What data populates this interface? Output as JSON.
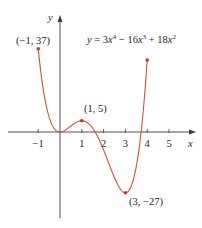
{
  "chart_data": {
    "type": "line",
    "equation": {
      "prefix": "y = 3",
      "x1": "x",
      "p1": "4",
      "mid1": " − 16",
      "x2": "x",
      "p2": "3",
      "mid2": " + 18",
      "x3": "x",
      "p3": "2"
    },
    "xlabel": "x",
    "ylabel": "y",
    "xlim": [
      -1.5,
      5.8
    ],
    "ylim": [
      -40,
      50
    ],
    "x_ticks": [
      {
        "value": -1,
        "label": "−1"
      },
      {
        "value": 1,
        "label": "1"
      },
      {
        "value": 2,
        "label": "2"
      },
      {
        "value": 3,
        "label": "3"
      },
      {
        "value": 4,
        "label": "4"
      },
      {
        "value": 5,
        "label": "5"
      }
    ],
    "domain": [
      -1,
      4
    ],
    "grid": false,
    "legend": null,
    "series": [
      {
        "name": "y = 3x^4 - 16x^3 + 18x^2",
        "color": "#c8553d",
        "x": [
          -1,
          -0.75,
          -0.5,
          -0.25,
          0,
          0.25,
          0.5,
          0.75,
          1,
          1.25,
          1.5,
          1.75,
          2,
          2.25,
          2.5,
          2.75,
          3,
          3.25,
          3.5,
          3.75,
          4
        ],
        "y": [
          37,
          17.87,
          7.19,
          1.7,
          0,
          0.9,
          2.69,
          4.21,
          5,
          4.26,
          1.69,
          -2.27,
          -8,
          -14.57,
          -20.31,
          -24.75,
          -27,
          -24.63,
          -15.69,
          2.85,
          32
        ]
      }
    ],
    "annotations": [
      {
        "x": -1,
        "y": 37,
        "label": "(−1, 37)"
      },
      {
        "x": 1,
        "y": 5,
        "label": "(1, 5)"
      },
      {
        "x": 3,
        "y": -27,
        "label": "(3, −27)"
      },
      {
        "x": 4,
        "y": 32,
        "label": ""
      }
    ]
  },
  "colors": {
    "curve": "#c8553d",
    "axis": "#3a3a3a",
    "text": "#231f20"
  }
}
